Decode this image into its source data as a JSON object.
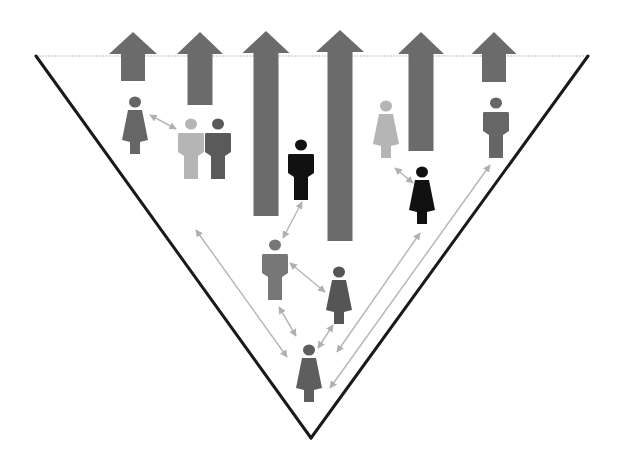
{
  "diagram": {
    "type": "inverted-pyramid-people-flow",
    "colors": {
      "background": "#ffffff",
      "triangle_stroke": "#1a1a1a",
      "top_edge": "#bdbdbd",
      "arrow_fill": "#6b6b6b",
      "connector": "#b8b8b8",
      "person_dark": "#111111",
      "person_mid": "#666666",
      "person_mid2": "#5a5a5a",
      "person_light": "#b5b5b5"
    },
    "triangle": {
      "top_left": [
        36,
        56
      ],
      "top_right": [
        588,
        56
      ],
      "bottom": [
        311,
        438
      ]
    },
    "up_arrows": [
      {
        "id": "arrow-1",
        "cx": 133,
        "tip_y": 32,
        "shaft_w": 24,
        "head_w": 48,
        "bottom_y": 81
      },
      {
        "id": "arrow-2",
        "cx": 200,
        "tip_y": 32,
        "shaft_w": 25,
        "head_w": 46,
        "bottom_y": 105
      },
      {
        "id": "arrow-3",
        "cx": 266,
        "tip_y": 31,
        "shaft_w": 25,
        "head_w": 47,
        "bottom_y": 216
      },
      {
        "id": "arrow-4",
        "cx": 340,
        "tip_y": 30,
        "shaft_w": 25,
        "head_w": 48,
        "bottom_y": 241
      },
      {
        "id": "arrow-5",
        "cx": 421,
        "tip_y": 32,
        "shaft_w": 25,
        "head_w": 46,
        "bottom_y": 151
      },
      {
        "id": "arrow-6",
        "cx": 494,
        "tip_y": 32,
        "shaft_w": 24,
        "head_w": 45,
        "bottom_y": 82
      }
    ],
    "people": [
      {
        "id": "woman-top-left",
        "gender": "female",
        "cx": 135,
        "head_y": 102,
        "color": "#666666"
      },
      {
        "id": "man-light-left",
        "gender": "male",
        "cx": 191,
        "head_y": 124,
        "color": "#b5b5b5"
      },
      {
        "id": "man-dark-left",
        "gender": "male",
        "cx": 218,
        "head_y": 124,
        "color": "#5a5a5a"
      },
      {
        "id": "man-black-center",
        "gender": "male",
        "cx": 301,
        "head_y": 145,
        "color": "#111111"
      },
      {
        "id": "woman-light-right",
        "gender": "female",
        "cx": 386,
        "head_y": 106,
        "color": "#b5b5b5"
      },
      {
        "id": "man-top-right",
        "gender": "male",
        "cx": 496,
        "head_y": 103,
        "color": "#666666"
      },
      {
        "id": "woman-black-right",
        "gender": "female",
        "cx": 422,
        "head_y": 172,
        "color": "#111111"
      },
      {
        "id": "man-mid-center",
        "gender": "male",
        "cx": 275,
        "head_y": 245,
        "color": "#777777"
      },
      {
        "id": "woman-mid-right",
        "gender": "female",
        "cx": 339,
        "head_y": 272,
        "color": "#555555"
      },
      {
        "id": "woman-bottom",
        "gender": "female",
        "cx": 309,
        "head_y": 350,
        "color": "#5e5e5e"
      }
    ],
    "connectors": [
      {
        "from": [
          150,
          115
        ],
        "to": [
          176,
          129
        ]
      },
      {
        "from": [
          196,
          230
        ],
        "to": [
          287,
          357
        ]
      },
      {
        "from": [
          283,
          238
        ],
        "to": [
          302,
          202
        ]
      },
      {
        "from": [
          290,
          263
        ],
        "to": [
          325,
          292
        ]
      },
      {
        "from": [
          279,
          307
        ],
        "to": [
          296,
          336
        ]
      },
      {
        "from": [
          333,
          325
        ],
        "to": [
          318,
          348
        ]
      },
      {
        "from": [
          395,
          168
        ],
        "to": [
          413,
          183
        ]
      },
      {
        "from": [
          420,
          233
        ],
        "to": [
          337,
          352
        ]
      },
      {
        "from": [
          490,
          165
        ],
        "to": [
          330,
          388
        ]
      }
    ]
  }
}
